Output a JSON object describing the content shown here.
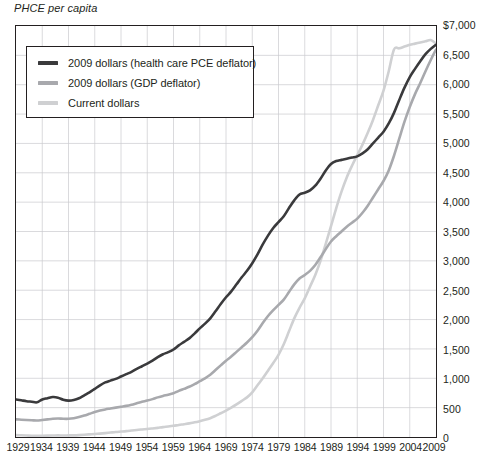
{
  "chart_data": {
    "type": "line",
    "title": "",
    "ylabel": "PHCE per capita",
    "xlabel": "",
    "ylim": [
      0,
      7000
    ],
    "xlim": [
      1929,
      2009
    ],
    "grid": true,
    "legend_position": "top-left-inside",
    "y_ticks": [
      "$7,000",
      "6,500",
      "6,000",
      "5,500",
      "5,000",
      "4,500",
      "4,000",
      "3,500",
      "3,000",
      "2,500",
      "2,000",
      "1,500",
      "1,000",
      "500",
      "0"
    ],
    "y_tick_values": [
      7000,
      6500,
      6000,
      5500,
      5000,
      4500,
      4000,
      3500,
      3000,
      2500,
      2000,
      1500,
      1000,
      500,
      0
    ],
    "x_ticks": [
      "1929",
      "1934",
      "1939",
      "1944",
      "1949",
      "1954",
      "1959",
      "1964",
      "1969",
      "1974",
      "1979",
      "1984",
      "1989",
      "1994",
      "1999",
      "2004",
      "2009"
    ],
    "x_tick_values": [
      1929,
      1934,
      1939,
      1944,
      1949,
      1954,
      1959,
      1964,
      1969,
      1974,
      1979,
      1984,
      1989,
      1994,
      1999,
      2004,
      2009
    ],
    "x": [
      1929,
      1930,
      1931,
      1932,
      1933,
      1934,
      1935,
      1936,
      1937,
      1938,
      1939,
      1940,
      1941,
      1942,
      1943,
      1944,
      1945,
      1946,
      1947,
      1948,
      1949,
      1950,
      1951,
      1952,
      1953,
      1954,
      1955,
      1956,
      1957,
      1958,
      1959,
      1960,
      1961,
      1962,
      1963,
      1964,
      1965,
      1966,
      1967,
      1968,
      1969,
      1970,
      1971,
      1972,
      1973,
      1974,
      1975,
      1976,
      1977,
      1978,
      1979,
      1980,
      1981,
      1982,
      1983,
      1984,
      1985,
      1986,
      1987,
      1988,
      1989,
      1990,
      1991,
      1992,
      1993,
      1994,
      1995,
      1996,
      1997,
      1998,
      1999,
      2000,
      2001,
      2002,
      2003,
      2004,
      2005,
      2006,
      2007,
      2008,
      2009
    ],
    "series": [
      {
        "name": "2009 dollars (health care PCE deflator)",
        "color": "#3a3a3c",
        "width": 2.6,
        "values": [
          640,
          625,
          610,
          600,
          590,
          640,
          660,
          680,
          670,
          635,
          620,
          630,
          660,
          710,
          760,
          820,
          880,
          930,
          960,
          990,
          1030,
          1070,
          1110,
          1160,
          1205,
          1250,
          1300,
          1360,
          1410,
          1445,
          1490,
          1560,
          1620,
          1680,
          1760,
          1850,
          1930,
          2020,
          2140,
          2265,
          2380,
          2480,
          2600,
          2720,
          2830,
          2960,
          3110,
          3280,
          3430,
          3560,
          3660,
          3760,
          3900,
          4030,
          4130,
          4160,
          4200,
          4280,
          4400,
          4540,
          4650,
          4700,
          4720,
          4740,
          4760,
          4780,
          4830,
          4900,
          5000,
          5100,
          5200,
          5340,
          5520,
          5740,
          5950,
          6130,
          6270,
          6400,
          6520,
          6610,
          6680
        ]
      },
      {
        "name": "2009 dollars (GDP deflator)",
        "color": "#a8a9ad",
        "width": 2.6,
        "values": [
          300,
          295,
          290,
          285,
          280,
          290,
          300,
          310,
          315,
          310,
          310,
          320,
          340,
          365,
          395,
          425,
          450,
          470,
          485,
          500,
          515,
          530,
          550,
          575,
          600,
          620,
          645,
          675,
          700,
          720,
          745,
          785,
          820,
          855,
          900,
          950,
          1000,
          1060,
          1140,
          1220,
          1300,
          1370,
          1450,
          1530,
          1610,
          1700,
          1810,
          1940,
          2060,
          2160,
          2250,
          2340,
          2470,
          2600,
          2700,
          2760,
          2830,
          2930,
          3060,
          3200,
          3330,
          3420,
          3500,
          3580,
          3650,
          3720,
          3820,
          3940,
          4080,
          4220,
          4360,
          4540,
          4790,
          5080,
          5370,
          5620,
          5840,
          6030,
          6230,
          6420,
          6600
        ]
      },
      {
        "name": "Current dollars",
        "color": "#cfd0d2",
        "width": 2.6,
        "values": [
          32,
          29,
          25,
          21,
          19,
          21,
          23,
          25,
          27,
          26,
          27,
          28,
          32,
          38,
          45,
          52,
          58,
          66,
          76,
          86,
          93,
          100,
          110,
          120,
          128,
          135,
          145,
          156,
          168,
          178,
          190,
          205,
          218,
          232,
          250,
          270,
          292,
          320,
          360,
          405,
          450,
          500,
          555,
          615,
          675,
          760,
          880,
          1000,
          1130,
          1260,
          1400,
          1580,
          1800,
          2020,
          2200,
          2360,
          2560,
          2760,
          3000,
          3290,
          3590,
          3900,
          4180,
          4420,
          4620,
          4800,
          4980,
          5180,
          5400,
          5650,
          5900,
          6230,
          6600,
          6620,
          6650,
          6680,
          6700,
          6720,
          6740,
          6760,
          6700
        ]
      }
    ]
  },
  "legend": {
    "items": [
      {
        "label": "2009 dollars (health care PCE deflator)",
        "color": "#3a3a3c"
      },
      {
        "label": "2009 dollars (GDP deflator)",
        "color": "#a8a9ad"
      },
      {
        "label": "Current dollars",
        "color": "#cfd0d2"
      }
    ]
  },
  "axis_title": "PHCE per capita"
}
